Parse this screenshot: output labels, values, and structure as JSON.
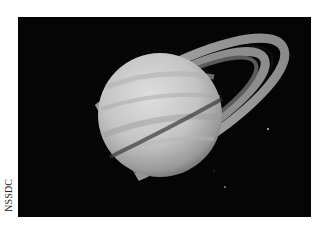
{
  "image": {
    "subject": "Saturn with rings",
    "style": "grayscale photograph",
    "background_color": "#050505",
    "planet_color": "#c8c8c8",
    "ring_color": "#9a9a9a"
  },
  "credit": {
    "text": "NSSDC"
  }
}
